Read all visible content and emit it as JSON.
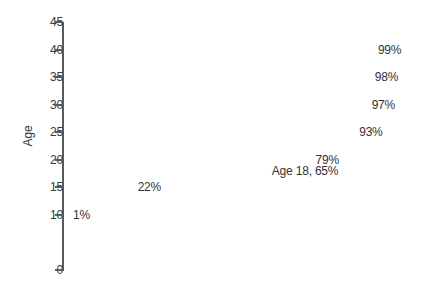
{
  "chart_data": {
    "type": "bar",
    "orientation": "horizontal",
    "title": "",
    "xlabel": "",
    "ylabel": "Age",
    "xlim": [
      0,
      100
    ],
    "ylim": [
      0,
      45
    ],
    "grid": false,
    "legend": null,
    "y_ticks": [
      "45",
      "40",
      "35",
      "30",
      "25",
      "20",
      "15",
      "10",
      "0"
    ],
    "y_tick_values": [
      45,
      40,
      35,
      30,
      25,
      20,
      15,
      10,
      0
    ],
    "categories": [
      40,
      35,
      30,
      25,
      20,
      18,
      15,
      10
    ],
    "values": [
      99,
      98,
      97,
      93,
      79,
      65,
      22,
      1
    ],
    "bars": [
      {
        "age": "40",
        "value": 99,
        "label": "99%",
        "color": "#b3b3b3",
        "highlight": false
      },
      {
        "age": "35",
        "value": 98,
        "label": "98%",
        "color": "#b3b3b3",
        "highlight": false
      },
      {
        "age": "30",
        "value": 97,
        "label": "97%",
        "color": "#b3b3b3",
        "highlight": false
      },
      {
        "age": "25",
        "value": 93,
        "label": "93%",
        "color": "#b3b3b3",
        "highlight": false
      },
      {
        "age": "20",
        "value": 79,
        "label": "79%",
        "color": "#b3b3b3",
        "highlight": false
      },
      {
        "age": "18",
        "value": 65,
        "label": "Age 18, 65%",
        "color": "#4a4a4a",
        "highlight": true
      },
      {
        "age": "15",
        "value": 22,
        "label": "22%",
        "color": "#b3b3b3",
        "highlight": false
      },
      {
        "age": "10",
        "value": 1,
        "label": "1%",
        "color": "#b3b3b3",
        "highlight": false
      }
    ],
    "colors": {
      "bar_default": "#b3b3b3",
      "bar_highlight": "#4a4a4a",
      "axis": "#5a5a5a",
      "text": "#333333",
      "background": "#ffffff"
    }
  }
}
